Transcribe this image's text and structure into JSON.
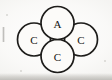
{
  "figure": {
    "kind": "overlapping-circles-diagram",
    "canvas": {
      "width": 112,
      "height": 80
    },
    "colors": {
      "background": "#fbfbfa",
      "circle_fill": "#fcfbf9",
      "stroke": "#1d1c1a",
      "label_text": "#141312",
      "scan_shadow": "#bab8b3"
    },
    "stroke_width": 1.7,
    "nodes": [
      {
        "id": "node-top",
        "label": "A",
        "position": "top",
        "cx": 57.5,
        "cy": 23,
        "r": 16.5,
        "font_size": 11
      },
      {
        "id": "node-left",
        "label": "C",
        "position": "left",
        "cx": 34,
        "cy": 39.5,
        "r": 16.5,
        "font_size": 11
      },
      {
        "id": "node-right",
        "label": "C",
        "position": "right",
        "cx": 81,
        "cy": 39.5,
        "r": 16.5,
        "font_size": 11
      },
      {
        "id": "node-bottom",
        "label": "C",
        "position": "bottom",
        "cx": 57.5,
        "cy": 56,
        "r": 16.5,
        "font_size": 11
      }
    ]
  }
}
